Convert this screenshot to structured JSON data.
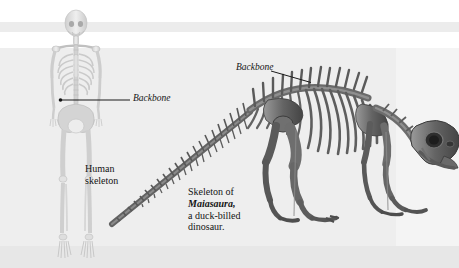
{
  "figure": {
    "running_head": "DE",
    "labels": {
      "backbone_human": "Backbone",
      "backbone_dino": "Backbone",
      "human_line1": "Human",
      "human_line2": "skeleton",
      "caption_line1": "Skeleton of",
      "caption_line2": "Maiasaura,",
      "caption_line3": "a duck-billed",
      "caption_line4": "dinosaur."
    },
    "artwork": {
      "human_skeleton_alt": "human-skeleton-photo",
      "dino_skeleton_alt": "maiasaura-skeleton-photo"
    },
    "colors": {
      "page_background": "#eeeeee",
      "rule_band": "#ececec",
      "text": "#141414",
      "leader_line": "#1b1b1b",
      "human_bone": "#d9d9d9",
      "dino_bone": "#6f6f6f"
    }
  }
}
